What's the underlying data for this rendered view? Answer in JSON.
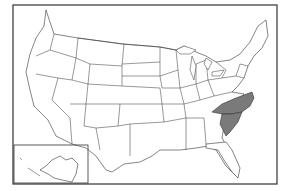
{
  "map": {
    "type": "us-states-outline",
    "highlighted_states": [
      "North Carolina",
      "South Carolina"
    ],
    "colors": {
      "highlight": "#7a7a7a",
      "state_fill": "#ffffff",
      "border": "#333333",
      "background": "#ffffff"
    },
    "insets": [
      "Alaska"
    ]
  }
}
